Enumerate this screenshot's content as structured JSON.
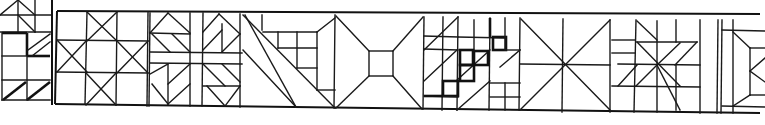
{
  "figure": {
    "type": "quilt-block-line-drawing-strip",
    "colors": {
      "line": "#1a1a1a",
      "background": "#ffffff"
    },
    "blocks": [
      {
        "name": "partial-block-left"
      },
      {
        "name": "ohio-star-variation"
      },
      {
        "name": "pinwheel-cross"
      },
      {
        "name": "diagonal-stripe-with-four-patch"
      },
      {
        "name": "bow-tie"
      },
      {
        "name": "jacobs-ladder"
      },
      {
        "name": "broken-dishes-x"
      },
      {
        "name": "eight-point-star"
      },
      {
        "name": "partial-block-right"
      }
    ]
  }
}
